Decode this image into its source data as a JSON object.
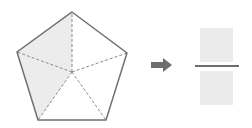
{
  "diagram": {
    "type": "fraction-of-pentagon",
    "pentagon": {
      "vertices": [
        [
          72,
          12
        ],
        [
          127,
          53
        ],
        [
          106,
          120
        ],
        [
          38,
          120
        ],
        [
          17,
          52
        ]
      ],
      "center": [
        72,
        72
      ],
      "sectors_total": 5,
      "sectors_shaded": 2,
      "shaded_fill": "#ececec",
      "stroke": "#707070",
      "dash_stroke": "#8a8a8a"
    },
    "arrow": {
      "color": "#6e6e6e",
      "direction": "right"
    },
    "fraction": {
      "numerator": "",
      "denominator": "",
      "box_color": "#ebebeb",
      "line_color": "#6e6e6e"
    }
  }
}
